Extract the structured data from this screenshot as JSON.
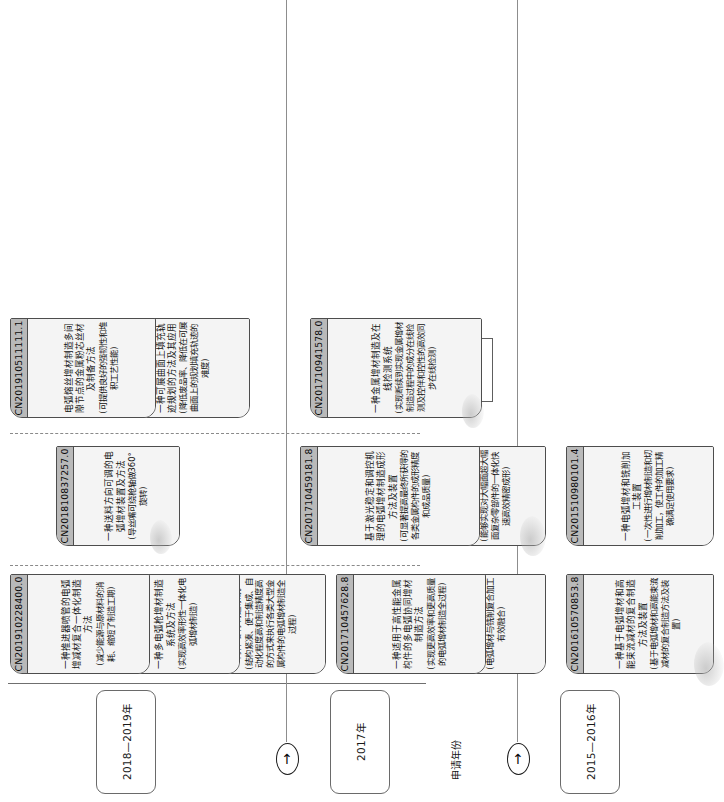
{
  "diagram": {
    "axis_title": "申请年份",
    "arrow_glyph": "↑",
    "periods": [
      {
        "label": "2015—2016年"
      },
      {
        "label": "2017年"
      },
      {
        "label": "2018—2019年"
      }
    ],
    "row_labels": [
      {
        "label": "制造方法"
      },
      {
        "label": "装置"
      },
      {
        "label": "材料制备\n检测模块\n算法"
      }
    ],
    "rows": {
      "method": {
        "label": "制造方法",
        "p2015_2016": [
          {
            "number": "CN201610570853.8",
            "title": "一种基于电弧增材和高能束流减材的复合制造方法及装置",
            "note": "(基于电弧增材和高能束流减材的复合制造方法及装置)"
          },
          {
            "number": "CN201610353372.1",
            "title": "一种电弧增材与铣削复合加工方法及其产品",
            "note": "(电弧增材与铣削复合加工有效融合)"
          }
        ],
        "p2017": [
          {
            "number": "CN201710457628.8",
            "title": "一种适用于高性能金属构件的多电弧协同增材制造方法",
            "note": "(实现更高效率和更高质量的电弧增材制造全过程)"
          },
          {
            "number": "CN201710457603.8",
            "title": "一种形性一体化的金属构件增材制造系统",
            "note": "(结构紧凑、便于集成、自动化程度高和制造精度高的方式来执行各类大型金属构件的电弧增材制造全过程)"
          }
        ],
        "p2018_2019": [
          {
            "number": "CN201910484521.1",
            "title": "一种多电弧枪增材制造系统及方法",
            "note": "(实现高效率形性一体化电弧增材制造)"
          },
          {
            "number": "CN201910228400.0",
            "title": "一种推进器喷管的电弧增减材复合一体化制造方法",
            "note": "(减少能源与原材料的消耗、缩短了制造工期)"
          }
        ]
      },
      "device": {
        "label": "装置",
        "p2015_2016": [
          {
            "number": "CN201510980101.4",
            "title": "一种电弧增材和铣削加工装置",
            "note": "(一次性进行增材制造和切削加工，使工件的加工精确满足使用要求)"
          },
          {
            "number": "CN201610931096.2",
            "title": "一种大幅面零部件的增减材复合制造设备",
            "note": "(能够实现对大幅面超大幅面复杂零部件的一体化快速高效精密成形)"
          }
        ],
        "p2017": [
          {
            "number": "CN201710459181.8",
            "title": "基于激光稳定和调控机理的电弧增材制造成形方法及装置",
            "note": "(可显著提高最终所获得的各类金属构件的成形精度和成品质量)"
          }
        ],
        "p2018_2019": [
          {
            "number": "CN201810837257.0",
            "title": "一种送料方向可调的电弧增材装置及方法",
            "note": "(导丝嘴可绕枪轴做360°旋转)"
          }
        ]
      },
      "material": {
        "label": "材料制备检测模块算法",
        "p2015_2016": [],
        "p2017": [
          {
            "number": "CN201710941578.0",
            "title": "一种金属增材制造及在线检测系统",
            "note": "(实现断续到实现金属增材制造过程中的成分在线检测及控伴和控性的高效同步在线检测)"
          }
        ],
        "p2018_2019": [
          {
            "number": "CN201910227767.0",
            "title": "一种可展曲面上填充轨迹规划的方法及其应用",
            "note": "(降低废品率、降低在可展曲面上的规划填充轨迹的难度)"
          },
          {
            "number": "CN201910511111.1",
            "title": "电弧熔丝增材制造多间隙节点的金属粉芯丝材及制备方法",
            "note": "(可提供良好的强韧性和堆积工艺性能)"
          }
        ]
      }
    }
  }
}
